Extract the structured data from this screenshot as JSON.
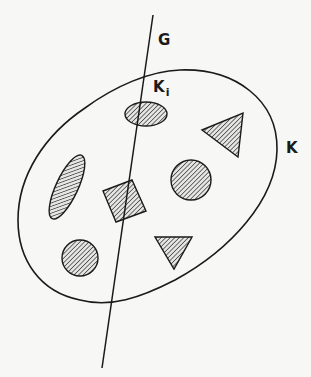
{
  "diagram": {
    "labels": {
      "line": "G",
      "outer_region": "K",
      "intersected_region_main": "K",
      "intersected_region_sub": "i"
    },
    "colors": {
      "stroke": "#1a1a1a",
      "hatch": "#2a2a2a",
      "background": "#f7f7f5",
      "shape_fill": "#d8d8d8"
    },
    "elements": [
      {
        "id": "line-G",
        "type": "line",
        "from": [
          153,
          15
        ],
        "to": [
          102,
          368
        ]
      },
      {
        "id": "region-K",
        "type": "closed-curve",
        "description": "large tilted ellipse"
      },
      {
        "id": "region-Ki",
        "type": "ellipse",
        "hatched": true,
        "center": [
          146,
          114
        ],
        "intersected_by_G": true
      },
      {
        "id": "triangle-1",
        "type": "triangle",
        "hatched": true
      },
      {
        "id": "ellipse-tilted",
        "type": "ellipse",
        "hatched": true
      },
      {
        "id": "square",
        "type": "square",
        "hatched": true,
        "intersected_by_G": true
      },
      {
        "id": "circle-1",
        "type": "circle",
        "hatched": true
      },
      {
        "id": "circle-2",
        "type": "circle",
        "hatched": true
      },
      {
        "id": "triangle-2",
        "type": "triangle-down",
        "hatched": true
      }
    ]
  }
}
